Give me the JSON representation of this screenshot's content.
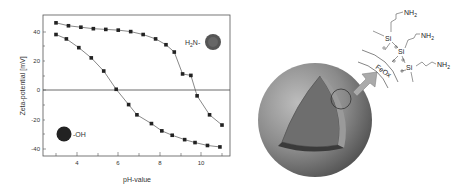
{
  "chart_data": {
    "type": "line",
    "title": "",
    "xlabel": "pH-value",
    "ylabel": "Zeta-potential [mV]",
    "xlim": [
      2.6,
      11.3
    ],
    "ylim": [
      -44,
      50
    ],
    "xticks": [
      4,
      6,
      8,
      10
    ],
    "yticks": [
      -40,
      -20,
      0,
      20,
      40
    ],
    "grid": false,
    "legend": "none",
    "reference_line": 0,
    "series": [
      {
        "name": "H2N-particle (amino-functionalized)",
        "marker": "square",
        "x": [
          3.0,
          3.6,
          4.2,
          4.8,
          5.4,
          6.0,
          6.6,
          7.2,
          7.8,
          8.3,
          8.7,
          9.1,
          9.5,
          9.8,
          10.4,
          11.0
        ],
        "y": [
          46,
          44,
          43,
          42,
          41.5,
          41,
          40,
          38,
          35,
          31,
          26,
          11,
          10,
          -4,
          -17,
          -24
        ]
      },
      {
        "name": "particle-OH (unmodified)",
        "marker": "square",
        "x": [
          3.0,
          3.5,
          4.1,
          4.7,
          5.3,
          5.9,
          6.5,
          6.9,
          7.6,
          8.1,
          8.6,
          9.2,
          9.7,
          10.3,
          10.9
        ],
        "y": [
          38,
          35,
          29,
          22,
          13,
          0.5,
          -10,
          -17,
          -23,
          -28,
          -31,
          -34,
          -36,
          -38,
          -39
        ]
      }
    ],
    "annotations": [
      "H2N-",
      "-OH"
    ]
  },
  "scheme": {
    "core_label": "FeOx",
    "atom_labels": [
      "Si",
      "Si",
      "Si"
    ],
    "group_labels": [
      "NH2",
      "NH2",
      "NH2"
    ]
  }
}
